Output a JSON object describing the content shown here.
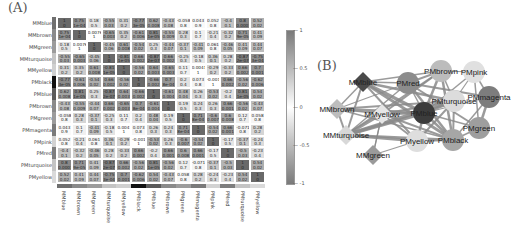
{
  "panels": {
    "a_label": "(A)",
    "b_label": "(B)"
  },
  "chart_data": [
    {
      "type": "heatmap",
      "title": "(A)",
      "rows": [
        "MMblue",
        "MMbrown",
        "MMgreen",
        "MMturquoise",
        "MMyellow",
        "PMblack",
        "PMblue",
        "PMbrown",
        "PMgreen",
        "PMmagenta",
        "PMpink",
        "PMred",
        "PMturquoise",
        "PMyellow"
      ],
      "columns": [
        "MMblue",
        "MMbrown",
        "MMgreen",
        "MMturquoise",
        "MMyellow",
        "PMblack",
        "PMblue",
        "PMbrown",
        "PMgreen",
        "PMmagenta",
        "PMpink",
        "PMred",
        "PMturquoise",
        "PMyellow"
      ],
      "values": [
        [
          1,
          0.75,
          0.18,
          -0.55,
          0.31,
          -0.77,
          0.62,
          -0.43,
          -0.058,
          0.043,
          0.052,
          -0.4,
          0.8,
          0.52
        ],
        [
          0.75,
          1,
          0.0076,
          -0.65,
          0.35,
          -0.61,
          0.81,
          -0.55,
          0.28,
          0.1,
          -0.21,
          -0.32,
          0.71,
          0.41
        ],
        [
          0.18,
          0.0076,
          1,
          -0.45,
          0.61,
          -0.54,
          0.25,
          -0.44,
          -0.37,
          -0.41,
          0.061,
          -0.46,
          0.41,
          0.44
        ],
        [
          -0.55,
          -0.65,
          -0.45,
          1,
          -0.81,
          0.66,
          -0.87,
          0.66,
          -0.25,
          -0.18,
          0.36,
          0.28,
          -0.87,
          -0.75
        ],
        [
          0.31,
          0.35,
          0.61,
          -0.81,
          1,
          -0.56,
          0.64,
          -0.65,
          0.11,
          0.0041,
          -0.29,
          -0.33,
          0.66,
          0.7
        ],
        [
          -0.77,
          -0.61,
          -0.54,
          0.66,
          -0.56,
          1,
          -0.66,
          0.7,
          0.2,
          0.073,
          -0.0014,
          0.66,
          -0.56,
          -0.62
        ],
        [
          0.62,
          0.81,
          0.25,
          -0.87,
          0.64,
          -0.66,
          1,
          -0.61,
          0.48,
          0.26,
          -0.53,
          -0.2,
          0.81,
          0.54
        ],
        [
          -0.43,
          -0.55,
          -0.44,
          0.66,
          -0.65,
          0.7,
          -0.61,
          1,
          0.19,
          0.24,
          0.26,
          0.66,
          -0.56,
          -0.43
        ],
        [
          -0.058,
          0.28,
          -0.37,
          -0.25,
          0.11,
          0.2,
          0.48,
          0.19,
          1,
          0.71,
          -0.6,
          0.6,
          0.12,
          0.058
        ],
        [
          0.043,
          0.1,
          -0.41,
          -0.18,
          0.0041,
          0.073,
          0.26,
          0.24,
          0.71,
          1,
          -0.54,
          0.66,
          -0.071,
          0.28
        ],
        [
          0.052,
          -0.21,
          0.061,
          0.36,
          -0.29,
          -0.0014,
          -0.53,
          0.26,
          -0.6,
          -0.54,
          1,
          -0.17,
          -0.37,
          -0.24
        ],
        [
          -0.4,
          -0.32,
          -0.46,
          0.28,
          -0.33,
          0.66,
          -0.2,
          0.66,
          0.6,
          0.66,
          -0.17,
          1,
          -0.5,
          -0.23
        ],
        [
          0.8,
          0.71,
          0.41,
          -0.87,
          0.66,
          -0.56,
          0.81,
          -0.56,
          0.12,
          -0.071,
          -0.37,
          -0.5,
          1,
          0.54
        ],
        [
          0.52,
          0.41,
          0.44,
          -0.75,
          0.7,
          -0.62,
          0.54,
          -0.43,
          0.058,
          0.28,
          -0.24,
          -0.23,
          0.54,
          1
        ]
      ],
      "pvalues": [
        [
          "0",
          "1e-04",
          "0.5",
          "0.03",
          "0.2",
          "3e-05",
          "0.008",
          "0.08",
          "0.8",
          "0.9",
          "0.8",
          "0.1",
          "0.0007",
          "0.02"
        ],
        [
          "1e-04",
          "0",
          "1",
          "0.003",
          "0.2",
          "0.006",
          "1e-05",
          "0.009",
          "0.3",
          "0.7",
          "0.4",
          "0.2",
          "9e-05",
          "0.09"
        ],
        [
          "0.5",
          "1",
          "0",
          "0.06",
          "0.008",
          "0.02",
          "0.3",
          "0.07",
          "0.1",
          "0.09",
          "0.8",
          "0.05",
          "0.09",
          "0.07"
        ],
        [
          "0.03",
          "0.003",
          "0.06",
          "0",
          "1e-05",
          "0.002",
          "2e-07",
          "0.002",
          "0.3",
          "0.5",
          "0.1",
          "0.2",
          "2e-07",
          "3e-04"
        ],
        [
          "0.2",
          "0.2",
          "0.008",
          "1e-05",
          "0",
          "0.02",
          "0.003",
          "0.003",
          "0.7",
          "1",
          "0.2",
          "0.2",
          "0.002",
          "0.001"
        ],
        [
          "3e-05",
          "0.006",
          "0.02",
          "0.002",
          "0.02",
          "0",
          "0.002",
          "8e-04",
          "0.4",
          "0.8",
          "1",
          "0.002",
          "0.02",
          "0.006"
        ],
        [
          "0.008",
          "1e-05",
          "0.3",
          "2e-07",
          "0.003",
          "0.002",
          "0",
          "0.004",
          "0.04",
          "0.3",
          "0.02",
          "0.4",
          "1e-05",
          "0.02"
        ],
        [
          "0.08",
          "0.009",
          "0.07",
          "0.002",
          "0.003",
          "8e-04",
          "0.004",
          "0",
          "0.5",
          "0.3",
          "0.3",
          "0.001",
          "0.02",
          "0.07"
        ],
        [
          "0.8",
          "0.3",
          "0.1",
          "0.3",
          "0.7",
          "0.4",
          "0.04",
          "0.5",
          "0",
          "8e-04",
          "0.007",
          "0.008",
          "0.7",
          "0.8"
        ],
        [
          "0.9",
          "0.7",
          "0.09",
          "0.5",
          "1",
          "0.8",
          "0.3",
          "0.3",
          "8e-04",
          "0",
          "0.02",
          "0.001",
          "0.8",
          "0.2"
        ],
        [
          "0.8",
          "0.4",
          "0.8",
          "0.1",
          "0.2",
          "1",
          "0.02",
          "0.3",
          "0.007",
          "0.02",
          "0",
          "0.5",
          "0.1",
          "0.3"
        ],
        [
          "0.1",
          "0.2",
          "0.05",
          "0.2",
          "0.2",
          "0.002",
          "0.4",
          "0.001",
          "0.008",
          "0.001",
          "0.5",
          "0",
          "0.03",
          "0.4"
        ],
        [
          "0.0007",
          "9e-05",
          "0.09",
          "2e-07",
          "0.002",
          "0.02",
          "1e-05",
          "0.02",
          "0.7",
          "0.8",
          "0.1",
          "0.03",
          "0",
          "0.02"
        ],
        [
          "0.02",
          "0.09",
          "0.07",
          "3e-04",
          "0.001",
          "0.006",
          "0.02",
          "0.07",
          "0.8",
          "0.2",
          "0.3",
          "0.4",
          "0.02",
          "0"
        ]
      ],
      "module_strip_colors": [
        "#6f6f6f",
        "#8a8a8a",
        "#9c9c9c",
        "#c4c4c4",
        "#d0d0d0",
        "#111111",
        "#5a5a5a",
        "#8a8a8a",
        "#9c9c9c",
        "#7a7a7a",
        "#d2d2d2",
        "#7e7e7e",
        "#c4c4c4",
        "#dadada"
      ],
      "colorbar": {
        "ticks": [
          "1",
          "0.5",
          "0",
          "-0.5",
          "-1"
        ],
        "range": [
          -1,
          1
        ]
      }
    },
    {
      "type": "network",
      "title": "(B)",
      "nodes": [
        {
          "id": "MMblue",
          "shape": "diamond",
          "x": 63,
          "y": 52,
          "color": "#4a4a4a"
        },
        {
          "id": "MMbrown",
          "shape": "diamond",
          "x": 37,
          "y": 79,
          "color": "#bdbdbd"
        },
        {
          "id": "MMyellow",
          "shape": "diamond",
          "x": 82,
          "y": 84,
          "color": "#e6e6e6"
        },
        {
          "id": "MMturquoise",
          "shape": "diamond",
          "x": 46,
          "y": 105,
          "color": "#d8d8d8"
        },
        {
          "id": "MMgreen",
          "shape": "diamond",
          "x": 73,
          "y": 125,
          "color": "#9a9a9a"
        },
        {
          "id": "PMred",
          "shape": "circle",
          "x": 108,
          "y": 53,
          "color": "#8c8c8c"
        },
        {
          "id": "PMbrown",
          "shape": "circle",
          "x": 141,
          "y": 41,
          "color": "#bcbcbc"
        },
        {
          "id": "PMpink",
          "shape": "circle",
          "x": 174,
          "y": 42,
          "color": "#e0e0e0"
        },
        {
          "id": "PMmagenta",
          "shape": "circle",
          "x": 189,
          "y": 67,
          "color": "#7d7d7d"
        },
        {
          "id": "PMturquoise",
          "shape": "circle",
          "x": 154,
          "y": 71,
          "color": "#dcdcdc"
        },
        {
          "id": "PMblue",
          "shape": "circle",
          "x": 124,
          "y": 83,
          "color": "#3c3c3c"
        },
        {
          "id": "PMgreen",
          "shape": "circle",
          "x": 179,
          "y": 98,
          "color": "#9e9e9e"
        },
        {
          "id": "PMyellow",
          "shape": "circle",
          "x": 117,
          "y": 111,
          "color": "#dedede"
        },
        {
          "id": "PMblack",
          "shape": "circle",
          "x": 153,
          "y": 110,
          "color": "#a6a6a6"
        }
      ],
      "edges": [
        [
          "MMblue",
          "PMblue",
          3.5
        ],
        [
          "MMblue",
          "PMblack",
          3
        ],
        [
          "MMblue",
          "MMturquoise",
          2
        ],
        [
          "MMblue",
          "MMbrown",
          1.5
        ],
        [
          "MMblue",
          "PMturquoise",
          2.5
        ],
        [
          "MMblue",
          "PMyellow",
          2
        ],
        [
          "MMblue",
          "PMred",
          1.5
        ],
        [
          "MMblue",
          "PMbrown",
          1.5
        ],
        [
          "MMbrown",
          "PMblue",
          3
        ],
        [
          "MMbrown",
          "MMturquoise",
          2
        ],
        [
          "MMbrown",
          "PMturquoise",
          2
        ],
        [
          "MMbrown",
          "PMblack",
          1.5
        ],
        [
          "MMbrown",
          "PMred",
          1.2
        ],
        [
          "MMbrown",
          "MMyellow",
          1.5
        ],
        [
          "MMyellow",
          "PMblue",
          2.5
        ],
        [
          "MMyellow",
          "MMturquoise",
          3
        ],
        [
          "MMyellow",
          "PMblack",
          2
        ],
        [
          "MMyellow",
          "PMturquoise",
          2
        ],
        [
          "MMyellow",
          "PMbrown",
          2
        ],
        [
          "MMyellow",
          "PMyellow",
          1.8
        ],
        [
          "MMyellow",
          "MMgreen",
          1.2
        ],
        [
          "MMturquoise",
          "PMblue",
          3.5
        ],
        [
          "MMturquoise",
          "PMturquoise",
          3.5
        ],
        [
          "MMturquoise",
          "PMyellow",
          3
        ],
        [
          "MMturquoise",
          "PMblack",
          2.5
        ],
        [
          "MMturquoise",
          "PMbrown",
          2
        ],
        [
          "MMturquoise",
          "PMred",
          1.5
        ],
        [
          "MMgreen",
          "PMyellow",
          1.2
        ],
        [
          "MMgreen",
          "MMyellow",
          1.2
        ],
        [
          "PMred",
          "PMblack",
          2.5
        ],
        [
          "PMred",
          "PMbrown",
          2
        ],
        [
          "PMred",
          "PMmagenta",
          2
        ],
        [
          "PMred",
          "PMgreen",
          2
        ],
        [
          "PMred",
          "PMblue",
          1.5
        ],
        [
          "PMbrown",
          "PMblack",
          2.5
        ],
        [
          "PMbrown",
          "PMblue",
          2.5
        ],
        [
          "PMbrown",
          "PMpink",
          1.2
        ],
        [
          "PMbrown",
          "PMturquoise",
          1.5
        ],
        [
          "PMpink",
          "PMmagenta",
          1.5
        ],
        [
          "PMpink",
          "PMgreen",
          1.5
        ],
        [
          "PMpink",
          "PMblue",
          1.5
        ],
        [
          "PMpink",
          "PMturquoise",
          1.2
        ],
        [
          "PMmagenta",
          "PMgreen",
          2.5
        ],
        [
          "PMmagenta",
          "PMblack",
          1.5
        ],
        [
          "PMmagenta",
          "PMblue",
          1.2
        ],
        [
          "PMturquoise",
          "PMblue",
          3
        ],
        [
          "PMturquoise",
          "PMblack",
          2
        ],
        [
          "PMturquoise",
          "PMyellow",
          2
        ],
        [
          "PMblue",
          "PMblack",
          2.5
        ],
        [
          "PMblue",
          "PMyellow",
          2.5
        ],
        [
          "PMblue",
          "PMgreen",
          1.5
        ],
        [
          "PMgreen",
          "PMblack",
          1.5
        ],
        [
          "PMyellow",
          "PMblack",
          2
        ]
      ]
    }
  ]
}
